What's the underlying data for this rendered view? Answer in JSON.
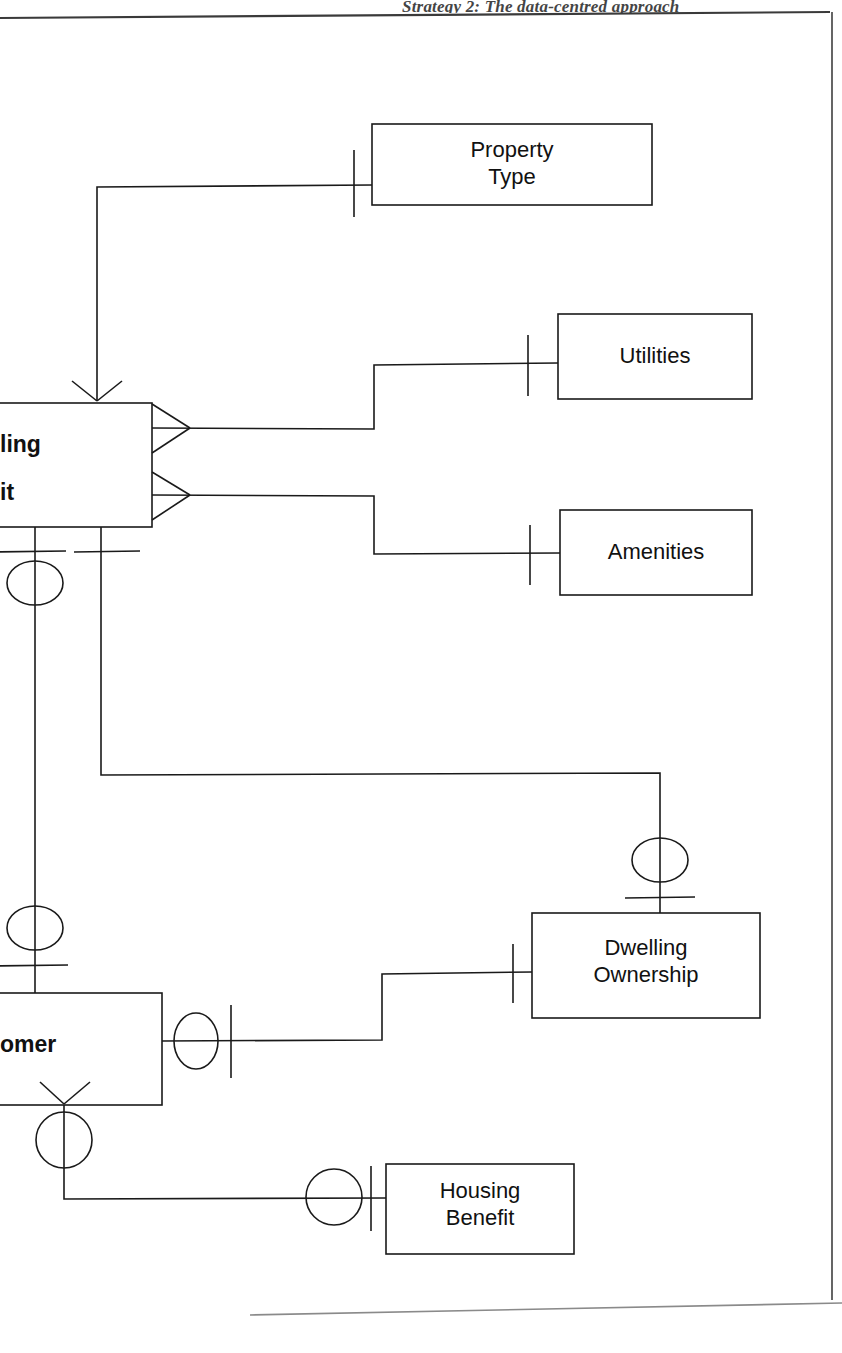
{
  "page": {
    "running_head": "Strategy 2: The data-centred approach",
    "width": 842,
    "height": 1353,
    "ink_color": "#1a1a1a",
    "background": "#ffffff"
  },
  "diagram": {
    "type": "entity-relationship-diagram",
    "notation": "crow's foot",
    "entities": [
      {
        "id": "property-type",
        "label": "Property\nType",
        "x": 372,
        "y": 124,
        "width": 280,
        "height": 81,
        "clipped": false
      },
      {
        "id": "utilities",
        "label": "Utilities",
        "x": 558,
        "y": 314,
        "width": 194,
        "height": 85,
        "clipped": false
      },
      {
        "id": "amenities",
        "label": "Amenities",
        "x": 560,
        "y": 510,
        "width": 192,
        "height": 85,
        "clipped": false
      },
      {
        "id": "dwelling-unit",
        "label": "Dwelling\nUnit",
        "visible_text": "ling\nit",
        "x": -60,
        "y": 403,
        "width": 212,
        "height": 124,
        "clipped": true
      },
      {
        "id": "dwelling-ownership",
        "label": "Dwelling\nOwnership",
        "x": 532,
        "y": 913,
        "width": 228,
        "height": 105,
        "clipped": false
      },
      {
        "id": "customer",
        "label": "Customer",
        "visible_text": "omer",
        "x": -70,
        "y": 993,
        "width": 232,
        "height": 112,
        "clipped": true
      },
      {
        "id": "housing-benefit",
        "label": "Housing\nBenefit",
        "x": 386,
        "y": 1164,
        "width": 188,
        "height": 90,
        "clipped": false
      }
    ],
    "relationships": [
      {
        "id": "dwelling-unit-property-type",
        "from": "dwelling-unit",
        "to": "property-type",
        "from_cardinality": "many",
        "to_cardinality": "one-mandatory"
      },
      {
        "id": "dwelling-unit-utilities",
        "from": "dwelling-unit",
        "to": "utilities",
        "from_cardinality": "many",
        "to_cardinality": "one-mandatory"
      },
      {
        "id": "dwelling-unit-amenities",
        "from": "dwelling-unit",
        "to": "amenities",
        "from_cardinality": "many",
        "to_cardinality": "one-mandatory"
      },
      {
        "id": "dwelling-unit-dwelling-ownership",
        "from": "dwelling-unit",
        "to": "dwelling-ownership",
        "from_cardinality": "one-mandatory",
        "to_cardinality": "zero-or-one"
      },
      {
        "id": "dwelling-unit-customer",
        "from": "dwelling-unit",
        "to": "customer",
        "from_cardinality": "zero-or-one",
        "to_cardinality": "zero-or-one"
      },
      {
        "id": "customer-dwelling-ownership",
        "from": "customer",
        "to": "dwelling-ownership",
        "from_cardinality": "zero-or-one",
        "to_cardinality": "one-mandatory"
      },
      {
        "id": "customer-housing-benefit",
        "from": "customer",
        "to": "housing-benefit",
        "from_cardinality": "zero-or-many",
        "to_cardinality": "zero-or-one"
      }
    ]
  }
}
